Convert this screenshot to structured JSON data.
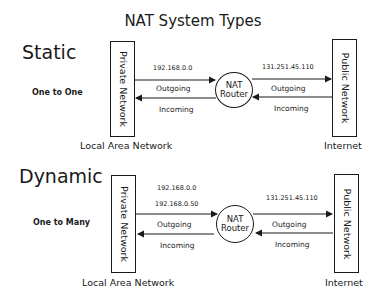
{
  "title": "NAT System Types",
  "static": {
    "heading": "Static",
    "mode": "One to One",
    "private_box": "Private Network",
    "public_box": "Public Network",
    "router_line1": "NAT",
    "router_line2": "Router",
    "private_ip": "192.168.0.0",
    "public_ip": "131.251.45.110",
    "left_outgoing": "Outgoing",
    "left_incoming": "Incoming",
    "right_outgoing": "Outgoing",
    "right_incoming": "Incoming",
    "lan_caption": "Local Area Network",
    "internet_caption": "Internet"
  },
  "dynamic": {
    "heading": "Dynamic",
    "mode": "One to Many",
    "private_box": "Private Network",
    "public_box": "Public Network",
    "router_line1": "NAT",
    "router_line2": "Router",
    "private_ip_start": "192.168.0.0",
    "private_ip_end": "192.168.0.50",
    "public_ip": "131.251.45.110",
    "left_outgoing": "Outgoing",
    "left_incoming": "Incoming",
    "right_outgoing": "Outgoing",
    "right_incoming": "Incoming",
    "lan_caption": "Local Area Network",
    "internet_caption": "Internet"
  }
}
